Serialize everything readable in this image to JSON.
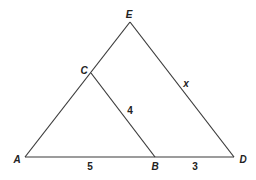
{
  "diagram": {
    "type": "geometry-triangle-similarity",
    "points": {
      "A": {
        "label": "A",
        "x": 25,
        "y": 157
      },
      "B": {
        "label": "B",
        "x": 155,
        "y": 157
      },
      "C": {
        "label": "C",
        "x": 91,
        "y": 73
      },
      "D": {
        "label": "D",
        "x": 234,
        "y": 157
      },
      "E": {
        "label": "E",
        "x": 130,
        "y": 22
      }
    },
    "segments": [
      {
        "from": "A",
        "to": "D"
      },
      {
        "from": "A",
        "to": "E"
      },
      {
        "from": "E",
        "to": "D"
      },
      {
        "from": "C",
        "to": "B"
      }
    ],
    "measures": {
      "AB": "5",
      "BD": "3",
      "CB": "4",
      "ED": "x"
    },
    "labels": {
      "A": "A",
      "B": "B",
      "C": "C",
      "D": "D",
      "E": "E",
      "ab_length": "5",
      "bd_length": "3",
      "cb_length": "4",
      "ed_length": "x"
    },
    "colors": {
      "line": "#3a3a3a",
      "text": "#222222",
      "background": "#ffffff"
    }
  }
}
